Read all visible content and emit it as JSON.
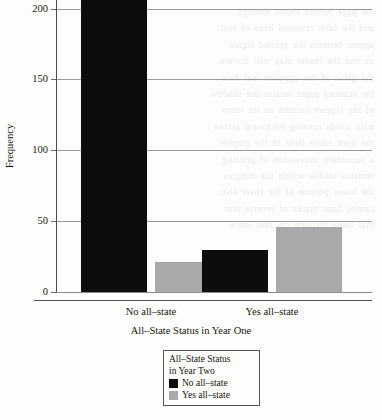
{
  "chart_data": {
    "type": "bar",
    "title": "",
    "xlabel": "All–State Status in Year One",
    "ylabel": "Frequency",
    "categories": [
      "No all–state",
      "Yes all–state"
    ],
    "series": [
      {
        "name": "No all–state",
        "color": "#0d0d0d",
        "values": [
          206,
          30
        ]
      },
      {
        "name": "Yes all–state",
        "color": "#a9a9a9",
        "values": [
          21,
          46
        ]
      }
    ],
    "ylim": [
      0,
      206
    ],
    "yticks": [
      0,
      50,
      100,
      150,
      200
    ],
    "ytick_labels": [
      "0",
      "50",
      "100",
      "150",
      "200"
    ],
    "grid": "horizontal",
    "legend_position": "below-plot-center",
    "legend_title": "All–State Status in Year Two"
  },
  "axes": {
    "y_title": "Frequency",
    "x_title": "All–State Status in Year One",
    "y_ticks": [
      {
        "value": 200,
        "label": "200"
      },
      {
        "value": 150,
        "label": "150"
      },
      {
        "value": 100,
        "label": "100"
      },
      {
        "value": 50,
        "label": "50"
      },
      {
        "value": 0,
        "label": "0"
      }
    ],
    "x_categories": [
      {
        "label": "No all–state"
      },
      {
        "label": "Yes all–state"
      }
    ]
  },
  "legend": {
    "title_line_1": "All–State Status",
    "title_line_2": "in Year Two",
    "entries": [
      {
        "label": "No all–state",
        "color": "#0d0d0d"
      },
      {
        "label": "Yes all–state",
        "color": "#a9a9a9"
      }
    ]
  },
  "colors": {
    "black_series": "#0d0d0d",
    "gray_series": "#a9a9a9",
    "gridline": "#9b9b9b",
    "axis": "#4a4a4a",
    "page_background": "#fdfdfb"
  },
  "bleed_through": {
    "lines": [
      "",
      "the page behind shows through",
      "",
      "and the faint reversed lines of text",
      "appear beneath the printed figure",
      "so that the reader may still discern",
      "the ghost of the opposite leaf here",
      "",
      "the scanned paper retains the shadow",
      "of the typeset column on its verso",
      "with words running backward across",
      "the open white field of the graphic",
      "",
      "a secondary impression of printing",
      "remains visible within the margins",
      "",
      "",
      "",
      "",
      "",
      "",
      "",
      "",
      "",
      "the lower portion of the sheet also",
      "",
      "",
      "carries faint marks of reverse text",
      "that bleed through the thin stock"
    ]
  }
}
